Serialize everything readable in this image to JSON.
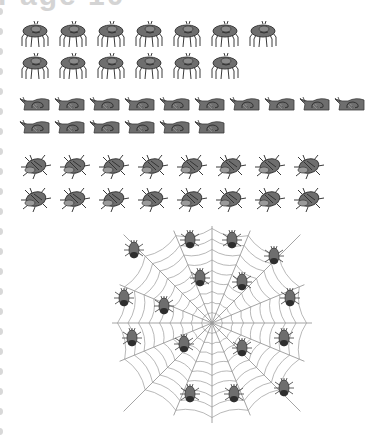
{
  "page": {
    "title": "Page 10"
  },
  "groups": [
    {
      "name": "spiders",
      "rows": [
        7,
        6
      ],
      "total": 13
    },
    {
      "name": "snails",
      "rows": [
        10,
        6
      ],
      "total": 16
    },
    {
      "name": "beetles",
      "rows": [
        8,
        8
      ],
      "total": 16
    },
    {
      "name": "bugs-on-web",
      "total": 16
    }
  ],
  "colors": {
    "creature_fill": "#6e6e6e",
    "creature_dark": "#3a3a3a",
    "web_line": "#9a9a9a",
    "binder_dot": "#d8d8d8"
  }
}
